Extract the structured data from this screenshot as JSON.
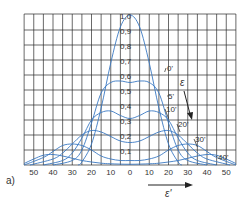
{
  "figure": {
    "panel_label": "a)",
    "x_axis_label": "ε'",
    "param_label": "ε",
    "colors": {
      "grid": "#2a2a2a",
      "curve": "#3a78c2",
      "text": "#333333",
      "background": "#ffffff"
    }
  },
  "chart_data": {
    "type": "line",
    "title": "",
    "xlabel": "ε'",
    "ylabel": "",
    "xlim": [
      -55,
      55
    ],
    "ylim": [
      0,
      1.0
    ],
    "grid": true,
    "x_tick_labels": [
      "50",
      "40",
      "30",
      "20",
      "10",
      "0",
      "10",
      "20",
      "30",
      "40",
      "50"
    ],
    "x_ticks": [
      -50,
      -40,
      -30,
      -20,
      -10,
      0,
      10,
      20,
      30,
      40,
      50
    ],
    "y_tick_labels": [
      "0,1",
      "0,2",
      "0,3",
      "0,4",
      "0,5",
      "0,6",
      "0,7",
      "0,8",
      "0,9",
      "1,0"
    ],
    "y_ticks": [
      0.1,
      0.2,
      0.3,
      0.4,
      0.5,
      0.6,
      0.7,
      0.8,
      0.9,
      1.0
    ],
    "parameter": "ε",
    "parameter_arrow_note": "ε increases in direction of arrow",
    "series": [
      {
        "name": "0'",
        "x": [
          -27,
          -25,
          -20,
          -15,
          -10,
          -5,
          0,
          5,
          10,
          15,
          20,
          25,
          27
        ],
        "y": [
          0,
          0.02,
          0.14,
          0.38,
          0.68,
          0.92,
          1.0,
          0.92,
          0.68,
          0.38,
          0.14,
          0.02,
          0
        ]
      },
      {
        "name": "5'",
        "x": [
          -40,
          -30,
          -25,
          -20,
          -15,
          -10,
          -5,
          0,
          5,
          10,
          15,
          20,
          25,
          30,
          40
        ],
        "y": [
          0,
          0.03,
          0.1,
          0.28,
          0.48,
          0.55,
          0.56,
          0.55,
          0.56,
          0.55,
          0.48,
          0.28,
          0.1,
          0.03,
          0
        ]
      },
      {
        "name": "10'",
        "x": [
          -45,
          -35,
          -30,
          -25,
          -20,
          -15,
          -10,
          -5,
          0,
          5,
          10,
          15,
          20,
          25,
          30,
          35,
          45
        ],
        "y": [
          0,
          0.03,
          0.08,
          0.18,
          0.3,
          0.35,
          0.36,
          0.33,
          0.31,
          0.33,
          0.36,
          0.35,
          0.3,
          0.18,
          0.08,
          0.03,
          0
        ]
      },
      {
        "name": "20'",
        "x": [
          -52,
          -40,
          -35,
          -30,
          -25,
          -20,
          -15,
          -10,
          -5,
          0,
          5,
          10,
          15,
          20,
          25,
          30,
          35,
          40,
          52
        ],
        "y": [
          0,
          0.04,
          0.08,
          0.14,
          0.2,
          0.23,
          0.22,
          0.19,
          0.16,
          0.15,
          0.16,
          0.19,
          0.22,
          0.23,
          0.2,
          0.14,
          0.08,
          0.04,
          0
        ]
      },
      {
        "name": "30'",
        "x": [
          -55,
          -45,
          -40,
          -35,
          -30,
          -25,
          -20,
          -15,
          -10,
          -5,
          0,
          5,
          10,
          15,
          20,
          25,
          30,
          35,
          40,
          45,
          55
        ],
        "y": [
          0,
          0.05,
          0.09,
          0.13,
          0.14,
          0.13,
          0.1,
          0.06,
          0.04,
          0.03,
          0.03,
          0.03,
          0.04,
          0.06,
          0.1,
          0.13,
          0.14,
          0.13,
          0.09,
          0.05,
          0
        ]
      },
      {
        "name": "40'",
        "x": [
          -55,
          -50,
          -45,
          -40,
          -35,
          -30,
          -25,
          -20,
          -15,
          -10,
          0,
          10,
          15,
          20,
          25,
          30,
          35,
          40,
          45,
          50,
          55
        ],
        "y": [
          0.01,
          0.04,
          0.065,
          0.07,
          0.06,
          0.045,
          0.03,
          0.02,
          0.012,
          0.008,
          0.005,
          0.008,
          0.012,
          0.02,
          0.03,
          0.045,
          0.06,
          0.07,
          0.065,
          0.04,
          0.01
        ]
      }
    ],
    "annotations": [
      {
        "text": "0'",
        "leader_to_x": 18,
        "leader_to_y": 0.62
      },
      {
        "text": "5'",
        "leader_to_x": 20,
        "leader_to_y": 0.46
      },
      {
        "text": "10'",
        "leader_to_x": 20,
        "leader_to_y": 0.31
      },
      {
        "text": "20'",
        "leader_to_x": 26,
        "leader_to_y": 0.22
      },
      {
        "text": "30'",
        "leader_to_x": 35,
        "leader_to_y": 0.12
      },
      {
        "text": "40'",
        "leader_to_x": 45,
        "leader_to_y": 0.06
      }
    ]
  }
}
